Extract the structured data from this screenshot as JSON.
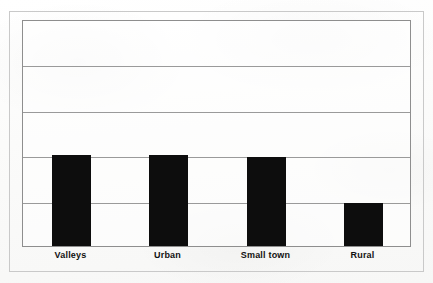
{
  "figure": {
    "background_color": "#fdfdfd",
    "outer_frame_color": "#c9c9c9",
    "plot_border_color": "#8e8e8e",
    "gridline_color": "#9a9a9a",
    "bar_color": "#0d0d0d",
    "label_color": "#111111"
  },
  "chart_data": {
    "type": "bar",
    "title": "",
    "subtitle": "",
    "xlabel": "",
    "ylabel": "",
    "categories": [
      "Valleys",
      "Urban",
      "Small town",
      "Rural"
    ],
    "values": [
      2.0,
      2.0,
      1.95,
      0.95
    ],
    "ylim": [
      0,
      5
    ],
    "yticks": [
      0,
      1,
      2,
      3,
      4,
      5
    ],
    "ytick_labels": [
      "",
      "",
      "",
      "",
      "",
      ""
    ],
    "grid": true,
    "grid_axis": "y",
    "gridline_count": 4,
    "legend": false,
    "legend_position": "none",
    "annotations": [],
    "series": [
      {
        "name": "",
        "color": "#0d0d0d",
        "values": [
          2.0,
          2.0,
          1.95,
          0.95
        ]
      }
    ]
  }
}
